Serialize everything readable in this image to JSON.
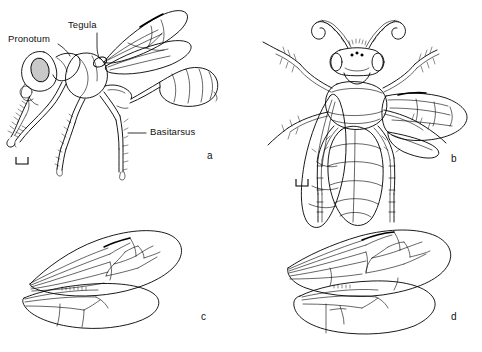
{
  "figure": {
    "kind": "scientific-illustration",
    "background_color": "#ffffff",
    "ink_color": "#000000",
    "eye_shade_color": "#c9c9c9",
    "panel_count": 4
  },
  "annotations": [
    {
      "id": "pronotum",
      "text": "Pronotum",
      "panel": "a",
      "x": 10,
      "y": 38,
      "leader": "points down-right to the pronotum on the thorax"
    },
    {
      "id": "tegula",
      "text": "Tegula",
      "panel": "a",
      "x": 68,
      "y": 24,
      "leader": "points down to the tegula at the wing base"
    },
    {
      "id": "basitarsus",
      "text": "Basitarsus",
      "panel": "a",
      "x": 148,
      "y": 130,
      "leader": "points left to the hind leg basitarsus"
    }
  ],
  "panels": [
    {
      "id": "a",
      "letter": "a",
      "letter_x": 207,
      "letter_y": 152,
      "caption_view": "lateral habitus",
      "has_scalebar": true,
      "scalebar_x": 16,
      "scalebar_y": 160
    },
    {
      "id": "b",
      "letter": "b",
      "letter_x": 452,
      "letter_y": 155,
      "caption_view": "dorsal habitus",
      "has_scalebar": true,
      "scalebar_x": 296,
      "scalebar_y": 180
    },
    {
      "id": "c",
      "letter": "c",
      "letter_x": 202,
      "letter_y": 313,
      "caption_view": "fore and hind wing venation",
      "has_scalebar": false
    },
    {
      "id": "d",
      "letter": "d",
      "letter_x": 452,
      "letter_y": 313,
      "caption_view": "fore and hind wing venation",
      "has_scalebar": false
    }
  ]
}
